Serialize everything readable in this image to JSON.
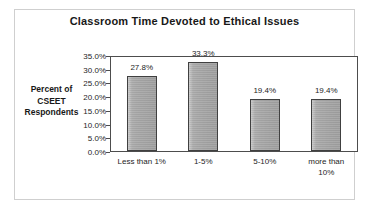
{
  "chart_data": {
    "type": "bar",
    "title": "Classroom Time Devoted to Ethical Issues",
    "xlabel": "",
    "ylabel": "Percent of CSEET Respondents",
    "ylabel_lines": [
      "Percent of",
      "CSEET",
      "Respondents"
    ],
    "categories": [
      "Less than 1%",
      "1-5%",
      "5-10%",
      "more than 10%"
    ],
    "category_lines": [
      [
        "Less than 1%"
      ],
      [
        "1-5%"
      ],
      [
        "5-10%"
      ],
      [
        "more than",
        "10%"
      ]
    ],
    "values": [
      27.8,
      33.3,
      19.4,
      19.4
    ],
    "data_labels": [
      "27.8%",
      "33.3%",
      "19.4%",
      "19.4%"
    ],
    "ylim": [
      0,
      35
    ],
    "ytick_values": [
      35,
      30,
      25,
      20,
      15,
      10,
      5,
      0
    ],
    "ytick_labels": [
      "35.0%",
      "30.0%",
      "25.0%",
      "20.0%",
      "15.0%",
      "10.0%",
      "5.0%",
      "0.0%"
    ],
    "grid": false,
    "legend": false,
    "bar_color": "#a6a6a6",
    "bar_edge_color": "#3d3d3d",
    "axis_color": "#4a4a4a",
    "text_color": "#1a1a1a",
    "background": "#ffffff"
  }
}
